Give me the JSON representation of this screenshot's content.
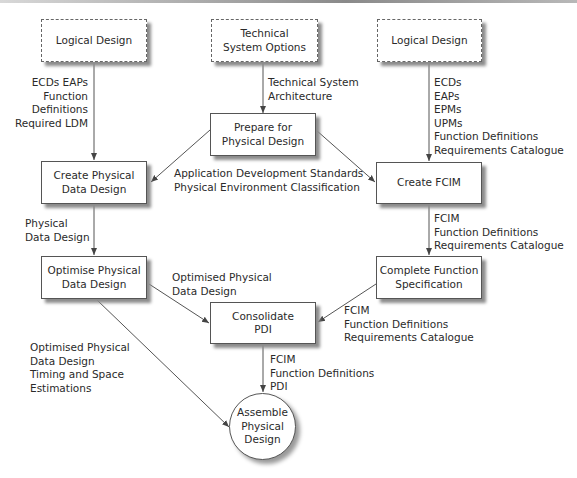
{
  "colors": {
    "line": "#555555",
    "shadow": "#8c8c8c",
    "text": "#2a2a2a"
  },
  "nodes": {
    "logical_design_left": "Logical Design",
    "technical_system_options": "Technical\nSystem Options",
    "logical_design_right": "Logical Design",
    "prepare_physical_design": "Prepare for\nPhysical Design",
    "create_physical_data_design": "Create Physical\nData Design",
    "create_fcim": "Create FCIM",
    "optimise_physical_data_design": "Optimise Physical\nData Design",
    "complete_function_specification": "Complete Function\nSpecification",
    "consolidate_pdi": "Consolidate\nPDI",
    "assemble_physical_design": "Assemble\nPhysical\nDesign"
  },
  "flows": {
    "logical_to_cpdd": "ECDs EAPs\nFunction\nDefinitions\nRequired LDM",
    "tso_to_prepare": "Technical System\nArchitecture",
    "logical_to_fcim": "ECDs\nEAPs\nEPMs\nUPMs\nFunction Definitions\nRequirements Catalogue",
    "prepare_outputs": "Application Development Standards\nPhysical Environment Classification",
    "cpdd_to_opdd": "Physical\nData Design",
    "fcim_to_cfs": "FCIM\nFunction Definitions\nRequirements Catalogue",
    "opdd_to_consolidate": "Optimised Physical\nData Design",
    "cfs_to_consolidate": "FCIM\nFunction Definitions\nRequirements Catalogue",
    "opdd_to_assemble": "Optimised Physical\nData Design\nTiming and Space\nEstimations",
    "consolidate_to_assemble": "FCIM\nFunction Definitions\nPDI"
  }
}
